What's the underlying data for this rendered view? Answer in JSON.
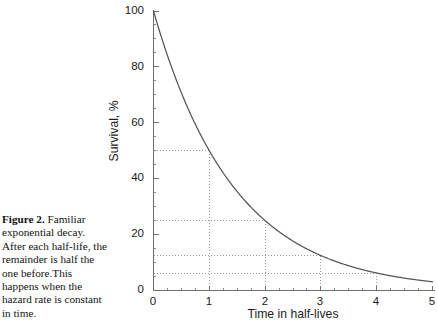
{
  "figure": {
    "caption_lead": "Figure 2.",
    "caption_body": " Familiar exponential decay. After each half-life, the remainder is half the one before.This happens when the hazard rate is constant in time."
  },
  "colors": {
    "curve": "#555555",
    "axis": "#6e6e6e",
    "guide": "#9a9a9a",
    "text": "#1b1b1b",
    "background": "#ffffff"
  },
  "chart_data": {
    "type": "line",
    "title": "",
    "xlabel": "Time in half-lives",
    "ylabel": "Survival, %",
    "xlim": [
      0,
      5
    ],
    "ylim": [
      0,
      100
    ],
    "xticks": [
      0,
      1,
      2,
      3,
      4,
      5
    ],
    "xtick_labels": [
      "0",
      "1",
      "2",
      "3",
      "4",
      "5"
    ],
    "yticks": [
      0,
      20,
      40,
      60,
      80,
      100
    ],
    "ytick_labels": [
      "0",
      "20",
      "40",
      "60",
      "80",
      "100"
    ],
    "x_minor_tick_step": 0.25,
    "y_minor_tick_step": 5,
    "grid": false,
    "legend": null,
    "series": [
      {
        "name": "Exponential decay",
        "formula": "y = 100 * 0.5^x",
        "x": [
          0,
          0.25,
          0.5,
          0.75,
          1,
          1.25,
          1.5,
          1.75,
          2,
          2.25,
          2.5,
          2.75,
          3,
          3.25,
          3.5,
          3.75,
          4,
          4.25,
          4.5,
          4.75,
          5
        ],
        "y": [
          100,
          84.09,
          70.71,
          59.46,
          50,
          42.04,
          35.36,
          29.73,
          25,
          21.02,
          17.68,
          14.87,
          12.5,
          10.51,
          8.84,
          7.43,
          6.25,
          5.26,
          4.42,
          3.72,
          3.125
        ]
      }
    ],
    "annotations": [
      {
        "type": "guide",
        "x": 1,
        "y": 50,
        "label": "50% at 1 half-life"
      },
      {
        "type": "guide",
        "x": 2,
        "y": 25,
        "label": "25% at 2 half-lives"
      },
      {
        "type": "guide",
        "x": 3,
        "y": 12.5,
        "label": "12.5% at 3 half-lives"
      },
      {
        "type": "guide",
        "x": 4,
        "y": 6.25,
        "label": "6.25% at 4 half-lives"
      }
    ]
  }
}
